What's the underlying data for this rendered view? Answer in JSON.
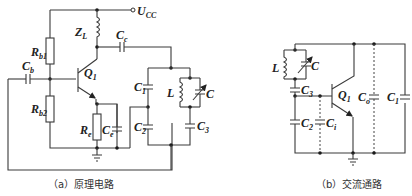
{
  "figure_a": {
    "caption": "（a）原理电路",
    "labels": {
      "supply": "U",
      "supply_sub": "CC",
      "rb1": "R",
      "rb1_sub": "b1",
      "rb2": "R",
      "rb2_sub": "b2",
      "zl": "Z",
      "zl_sub": "L",
      "cc": "C",
      "cc_sub": "c",
      "cb": "C",
      "cb_sub": "b",
      "q1": "Q",
      "q1_sub": "1",
      "re": "R",
      "re_sub": "e",
      "ce": "C",
      "ce_sub": "e",
      "c1": "C",
      "c1_sub": "1",
      "c2": "C",
      "c2_sub": "2",
      "c3": "C",
      "c3_sub": "3",
      "l": "L",
      "c": "C"
    }
  },
  "figure_b": {
    "caption": "（b）交流通路",
    "labels": {
      "l": "L",
      "c": "C",
      "c3": "C",
      "c3_sub": "3",
      "q1": "Q",
      "q1_sub": "1",
      "co": "C",
      "co_sub": "o",
      "c1": "C",
      "c1_sub": "1",
      "c2": "C",
      "c2_sub": "2",
      "ci": "C",
      "ci_sub": "i"
    }
  }
}
